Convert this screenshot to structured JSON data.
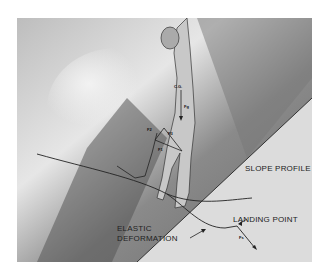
{
  "diagram": {
    "labels": {
      "cg": "C.G.",
      "force_gravity": "Fg",
      "force_2": "F2",
      "force_3": "F3",
      "force_1": "F1",
      "force_surface": "Fs",
      "slope_profile": "SLOPE PROFILE",
      "landing_point": "LANDING POINT",
      "elastic_deformation_line1": "ELASTIC",
      "elastic_deformation_line2": "DEFORMATION"
    },
    "colors": {
      "background": "#ffffff",
      "shading_dark": "#5a5a5a",
      "shading_light": "#e8e8e8",
      "line": "#222222"
    }
  }
}
